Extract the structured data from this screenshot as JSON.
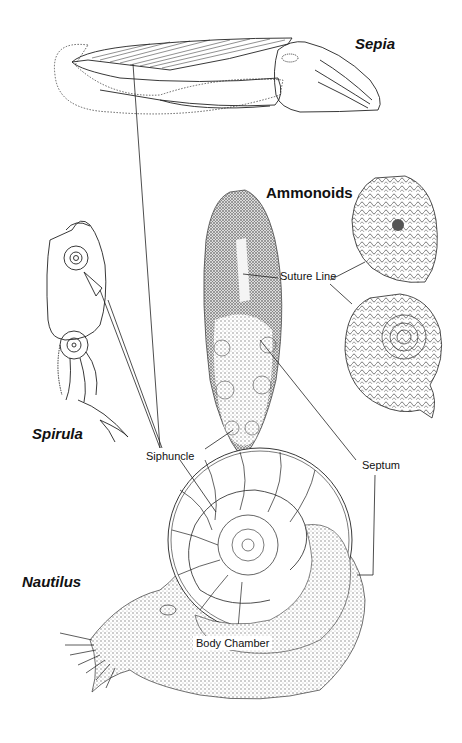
{
  "taxa": {
    "sepia": "Sepia",
    "spirula": "Spirula",
    "ammonoids": "Ammonoids",
    "nautilus": "Nautilus"
  },
  "parts": {
    "suture_line": "Suture Line",
    "siphuncle": "Siphuncle",
    "septum": "Septum",
    "body_chamber": "Body Chamber"
  },
  "colors": {
    "ink": "#222222",
    "background": "#ffffff",
    "stipple": "#9a9a9a"
  }
}
